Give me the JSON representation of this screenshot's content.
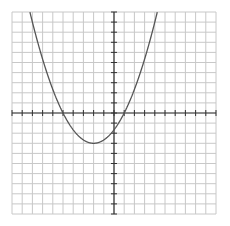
{
  "chart_data": {
    "type": "line",
    "title": "",
    "xlabel": "",
    "ylabel": "",
    "xlim": [
      -10,
      10
    ],
    "ylim": [
      -10,
      10
    ],
    "grid": true,
    "grid_step": 1,
    "tick_labels": false,
    "series": [
      {
        "name": "parabola",
        "equation": "y = (1/3)(x + 5)(x - 1)",
        "x_intercepts": [
          -5,
          1
        ],
        "vertex": [
          -2,
          -3
        ],
        "y_intercept": -1.667,
        "x": [
          -8.4,
          -8,
          -7,
          -6,
          -5,
          -4,
          -3,
          -2,
          -1,
          0,
          1,
          2,
          3,
          4
        ],
        "values": [
          10.6,
          9,
          5.33,
          2.33,
          0,
          -1.67,
          -2.67,
          -3,
          -2.67,
          -1.67,
          0,
          2.33,
          5.33,
          9
        ]
      }
    ]
  },
  "colors": {
    "grid": "#c8c8c8",
    "axis": "#333333",
    "curve": "#555555",
    "background": "#ffffff"
  }
}
